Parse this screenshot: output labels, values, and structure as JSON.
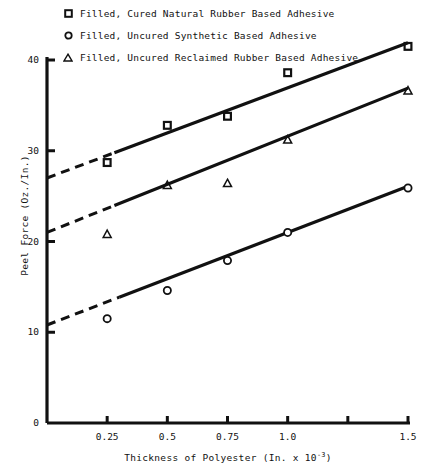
{
  "chart_data": {
    "type": "scatter",
    "title": "",
    "xlabel": "Thickness of Polyester (In. x 10-3)",
    "xlabel_base": "Thickness of Polyester (In. x 10",
    "xlabel_exp": "-3",
    "xlabel_tail": ")",
    "ylabel": "Peel Force (Oz./In.)",
    "xlim": [
      0,
      1.55
    ],
    "ylim": [
      0,
      44
    ],
    "grid": false,
    "legend_position": "top-left",
    "xticks": [
      {
        "value": 0.25,
        "label": "0.25"
      },
      {
        "value": 0.5,
        "label": "0.5"
      },
      {
        "value": 0.75,
        "label": "0.75"
      },
      {
        "value": 1.0,
        "label": "1.0"
      },
      {
        "value": 1.25,
        "label": ""
      },
      {
        "value": 1.5,
        "label": "1.5"
      }
    ],
    "yticks": [
      {
        "value": 0,
        "label": "0"
      },
      {
        "value": 10,
        "label": "10"
      },
      {
        "value": 20,
        "label": "20"
      },
      {
        "value": 30,
        "label": "30"
      },
      {
        "value": 40,
        "label": "40"
      }
    ],
    "series": [
      {
        "name": "Filled, Cured Natural Rubber Based Adhesive",
        "marker": "square",
        "x": [
          0.25,
          0.5,
          0.75,
          1.0,
          1.5
        ],
        "y": [
          28.7,
          32.8,
          33.8,
          38.6,
          41.5
        ],
        "fit_line": {
          "x0": 0.0,
          "y0": 27.0,
          "x1": 1.5,
          "y1": 41.9
        },
        "dashed_from_x": 0.0,
        "dashed_to_x": 0.28
      },
      {
        "name": "Filled, Uncured Synthetic Based Adhesive",
        "marker": "circle",
        "x": [
          0.25,
          0.5,
          0.75,
          1.0,
          1.5
        ],
        "y": [
          11.5,
          14.6,
          17.9,
          21.0,
          25.9
        ],
        "fit_line": {
          "x0": 0.0,
          "y0": 10.8,
          "x1": 1.5,
          "y1": 26.1
        },
        "dashed_from_x": 0.0,
        "dashed_to_x": 0.3
      },
      {
        "name": "Filled, Uncured Reclaimed Rubber Based Adhesive",
        "marker": "triangle",
        "x": [
          0.25,
          0.5,
          0.75,
          1.0,
          1.5
        ],
        "y": [
          20.8,
          26.2,
          26.4,
          31.2,
          36.6
        ],
        "fit_line": {
          "x0": 0.0,
          "y0": 21.0,
          "x1": 1.5,
          "y1": 36.9
        },
        "dashed_from_x": 0.0,
        "dashed_to_x": 0.28
      }
    ]
  },
  "legend": {
    "items": [
      {
        "marker": "square",
        "label": "Filled, Cured Natural Rubber Based Adhesive"
      },
      {
        "marker": "circle",
        "label": "Filled, Uncured Synthetic Based Adhesive"
      },
      {
        "marker": "triangle",
        "label": "Filled, Uncured Reclaimed Rubber Based Adhesive"
      }
    ]
  },
  "colors": {
    "ink": "#111111",
    "background": "#ffffff"
  }
}
